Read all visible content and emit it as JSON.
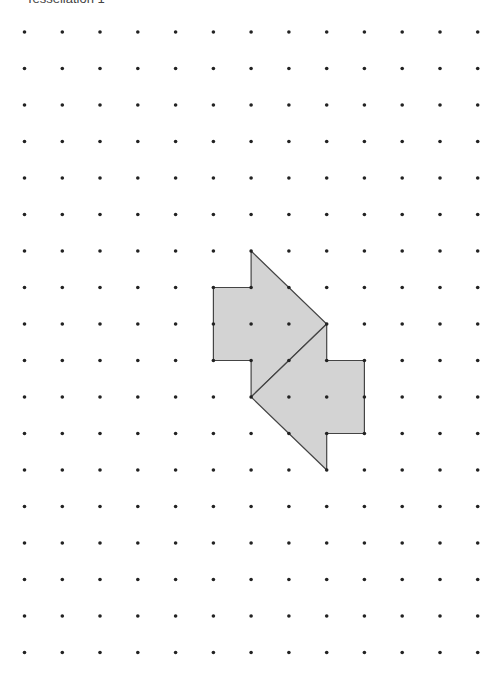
{
  "title": "Tessellation 1",
  "grid": {
    "cols": 13,
    "rows": 18,
    "x0": 24.5,
    "dx": 37.77,
    "y0": 32,
    "dy": 36.5,
    "dot_color": "#222222",
    "dot_radius": 1.8
  },
  "shapes": [
    {
      "name": "upper-arrow-tile",
      "fill": "#d3d3d3",
      "stroke": "#444444",
      "points": [
        [
          6,
          6
        ],
        [
          8,
          8
        ],
        [
          6,
          10
        ],
        [
          6,
          9
        ],
        [
          5,
          9
        ],
        [
          5,
          7
        ],
        [
          6,
          7
        ]
      ]
    },
    {
      "name": "lower-arrow-tile",
      "fill": "#d3d3d3",
      "stroke": "#444444",
      "points": [
        [
          8,
          8
        ],
        [
          8,
          9
        ],
        [
          9,
          9
        ],
        [
          9,
          11
        ],
        [
          8,
          11
        ],
        [
          8,
          12
        ],
        [
          6,
          10
        ]
      ]
    }
  ]
}
